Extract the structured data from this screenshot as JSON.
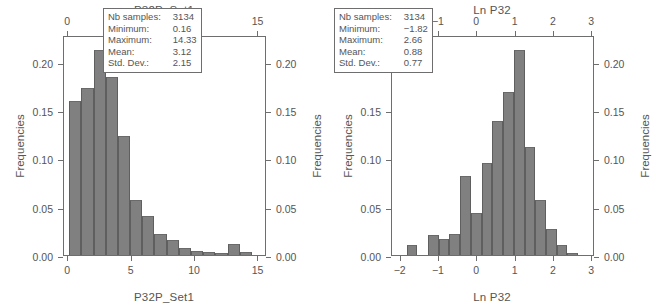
{
  "figure": {
    "background": "#ffffff",
    "bar_color": "#808080",
    "axis_color": "#6e6e6e",
    "text_color": "#555555"
  },
  "panels": [
    {
      "id": "left",
      "title": "P32P_Set1",
      "xlabel_bottom": "P32P_Set1",
      "ylabel_left": "Frequencies",
      "ylabel_right": "Frequencies",
      "stats": {
        "rows": [
          {
            "key": "Nb samples:",
            "value": "3134"
          },
          {
            "key": "Minimum:",
            "value": "0.16"
          },
          {
            "key": "Maximum:",
            "value": "14.33"
          },
          {
            "key": "Mean:",
            "value": "3.12"
          },
          {
            "key": "Std. Dev.:",
            "value": "2.15"
          }
        ]
      }
    },
    {
      "id": "right",
      "title": "Ln P32",
      "xlabel_bottom": "Ln P32",
      "ylabel_left": "Frequencies",
      "ylabel_right": "Frequencies",
      "stats": {
        "rows": [
          {
            "key": "Nb samples:",
            "value": "3134"
          },
          {
            "key": "Minimum:",
            "value": "−1.82"
          },
          {
            "key": "Maximum:",
            "value": "2.66"
          },
          {
            "key": "Mean:",
            "value": "0.88"
          },
          {
            "key": "Std. Dev.:",
            "value": "0.77"
          }
        ]
      }
    }
  ],
  "chart_data": [
    {
      "type": "bar",
      "id": "p32p-set1-histogram",
      "title": "P32P_Set1",
      "xlabel": "P32P_Set1",
      "ylabel": "Frequencies",
      "xlim": [
        -0.25,
        15.75
      ],
      "ylim": [
        0.0,
        0.2275
      ],
      "grid": false,
      "legend": null,
      "xticks": [
        0,
        5,
        10,
        15
      ],
      "xticklabels": [
        "0",
        "5",
        "10",
        "15"
      ],
      "yticks": [
        0.0,
        0.05,
        0.1,
        0.15,
        0.2
      ],
      "yticklabels": [
        "0.00",
        "0.05",
        "0.10",
        "0.15",
        "0.20"
      ],
      "bin_width": 0.96,
      "bin_starts": [
        0.16,
        1.12,
        2.08,
        3.04,
        4.0,
        4.96,
        5.92,
        6.88,
        7.84,
        8.8,
        9.76,
        10.72,
        11.68,
        12.64,
        13.6
      ],
      "values": [
        0.159,
        0.173,
        0.212,
        0.184,
        0.123,
        0.057,
        0.04,
        0.022,
        0.016,
        0.007,
        0.004,
        0.003,
        0.002,
        0.011,
        0.003
      ],
      "annotations": [
        "Nb samples: 3134",
        "Minimum: 0.16",
        "Maximum: 14.33",
        "Mean: 3.12",
        "Std. Dev.: 2.15"
      ]
    },
    {
      "type": "bar",
      "id": "ln-p32-histogram",
      "title": "Ln P32",
      "xlabel": "Ln P32",
      "ylabel": "Frequencies",
      "xlim": [
        -2.2,
        3.1
      ],
      "ylim": [
        0.0,
        0.2275
      ],
      "grid": false,
      "legend": null,
      "xticks": [
        -2,
        -1,
        0,
        1,
        2,
        3
      ],
      "xticklabels": [
        "−2",
        "−1",
        "0",
        "1",
        "2",
        "3"
      ],
      "yticks": [
        0.0,
        0.05,
        0.1,
        0.15,
        0.2
      ],
      "yticklabels": [
        "0.00",
        "0.05",
        "0.10",
        "0.15",
        "0.20"
      ],
      "bin_width": 0.28,
      "bin_starts": [
        -1.82,
        -1.54,
        -1.26,
        -0.98,
        -0.7,
        -0.42,
        -0.14,
        0.14,
        0.42,
        0.7,
        0.98,
        1.26,
        1.54,
        1.82,
        2.1,
        2.38
      ],
      "values": [
        0.01,
        0.0,
        0.021,
        0.017,
        0.022,
        0.082,
        0.043,
        0.095,
        0.139,
        0.169,
        0.212,
        0.112,
        0.057,
        0.027,
        0.01,
        0.002
      ],
      "annotations": [
        "Nb samples: 3134",
        "Minimum: −1.82",
        "Maximum: 2.66",
        "Mean: 0.88",
        "Std. Dev.: 0.77"
      ]
    }
  ]
}
